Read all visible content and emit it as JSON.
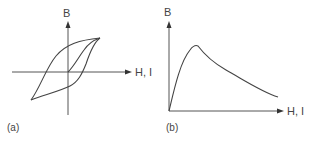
{
  "panels": [
    {
      "id": "a",
      "caption": "(a)",
      "y_axis_label": "B",
      "x_axis_label": "H, I",
      "description": "Hysteresis loop with initial magnetization curve"
    },
    {
      "id": "b",
      "caption": "(b)",
      "y_axis_label": "B",
      "x_axis_label": "H, I",
      "description": "Curve rising steeply to a peak then decaying"
    }
  ]
}
